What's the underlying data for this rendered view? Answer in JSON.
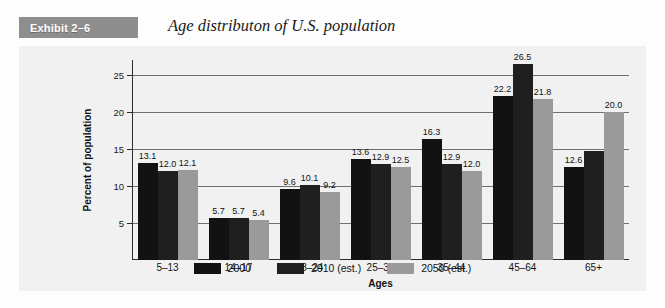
{
  "header": {
    "exhibit_tag": "Exhibit 2–6",
    "title": "Age distributon of U.S. population"
  },
  "legend": {
    "items": [
      {
        "label": "2000",
        "color": "#121212"
      },
      {
        "label": "2010 (est.)",
        "color": "#1f1f1f"
      },
      {
        "label": "2050 (est.)",
        "color": "#9a9a9a"
      }
    ]
  },
  "chart_data": {
    "type": "bar",
    "title": "Age distributon of U.S. population",
    "xlabel": "Ages",
    "ylabel": "Percent of population",
    "ylim": [
      0,
      27
    ],
    "yticks": [
      5,
      10,
      15,
      20,
      25
    ],
    "grid": true,
    "legend_position": "bottom",
    "categories": [
      "5–13",
      "14–17",
      "18–24",
      "25–34",
      "35–44",
      "45–64",
      "65+"
    ],
    "series": [
      {
        "name": "2000",
        "color": "#121212",
        "values": [
          13.1,
          5.7,
          9.6,
          13.6,
          16.3,
          22.2,
          12.6
        ],
        "labels": [
          "13.1",
          "5.7",
          "9.6",
          "13.6",
          "16.3",
          "22.2",
          "12.6"
        ]
      },
      {
        "name": "2010 (est.)",
        "color": "#1f1f1f",
        "values": [
          12.0,
          5.7,
          10.1,
          12.9,
          12.9,
          26.5,
          14.7
        ],
        "labels": [
          "12.0",
          "5.7",
          "10.1",
          "12.9",
          "12.9",
          "26.5",
          ""
        ]
      },
      {
        "name": "2050 (est.)",
        "color": "#9a9a9a",
        "values": [
          12.1,
          5.4,
          9.2,
          12.5,
          12.0,
          21.8,
          20.0
        ],
        "labels": [
          "12.1",
          "5.4",
          "9.2",
          "12.5",
          "12.0",
          "21.8",
          "20.0"
        ]
      }
    ]
  }
}
